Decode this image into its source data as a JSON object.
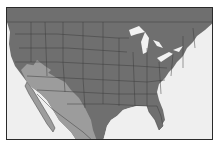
{
  "map": {
    "type": "range-map",
    "region": "United States and Mexico",
    "colors": {
      "background": "#efefef",
      "land": "#6f6f6f",
      "range_highlight": "#9c9c9c",
      "borders": "#3c3c3c",
      "water": "#f2f2f2",
      "frame": "#2a2a2a"
    },
    "highlighted_range": "Southwestern United States and western/central Mexico"
  }
}
